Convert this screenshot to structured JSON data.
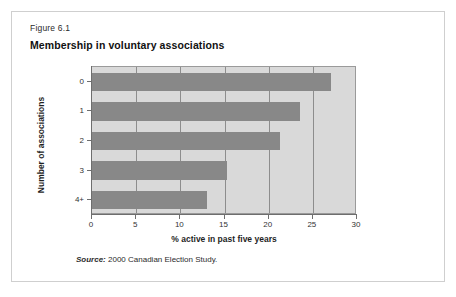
{
  "figure": {
    "number": "Figure 6.1",
    "title": "Membership in voluntary associations",
    "source_label": "Source:",
    "source_text": " 2000 Canadian Election Study."
  },
  "colors": {
    "plot_background": "#d9d9d9",
    "bar_fill": "#888888",
    "gridline": "#8d8d8d",
    "axis": "#6e6e6e",
    "frame_border": "#cfcfcf"
  },
  "chart_data": {
    "type": "bar",
    "orientation": "horizontal",
    "title": "Membership in voluntary associations",
    "categories": [
      "0",
      "1",
      "2",
      "3",
      "4+"
    ],
    "values": [
      27.0,
      23.5,
      21.3,
      15.3,
      13.0
    ],
    "xlabel": "% active in past five years",
    "ylabel": "Number of associations",
    "xlim": [
      0,
      30
    ],
    "xticks": [
      0,
      5,
      10,
      15,
      20,
      25,
      30
    ],
    "xtick_labels": [
      "0",
      "5",
      "10",
      "15",
      "20",
      "25",
      "30"
    ],
    "grid": true,
    "grid_axis": "x",
    "legend": false
  }
}
